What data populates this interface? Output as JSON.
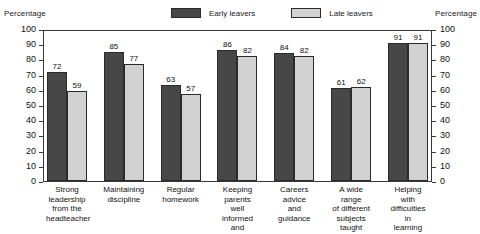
{
  "axis_caption_left": "Percentage",
  "axis_caption_right": "Percentage",
  "legend": {
    "items": [
      {
        "label": "Early leavers",
        "swatch": "dark-gray-swatch",
        "color": "#474747"
      },
      {
        "label": "Late leavers",
        "swatch": "light-gray-swatch",
        "color": "#d2d2d2"
      }
    ]
  },
  "chart_data": {
    "type": "bar",
    "title": "",
    "xlabel": "",
    "ylabel": "Percentage",
    "ylim": [
      0,
      100
    ],
    "yticks": [
      0,
      10,
      20,
      30,
      40,
      50,
      60,
      70,
      80,
      90,
      100
    ],
    "ytick_labels": [
      "0",
      "10",
      "20",
      "30",
      "40",
      "50",
      "60",
      "70",
      "80",
      "90",
      "100"
    ],
    "grid": false,
    "legend_position": "top-center",
    "dual_axis": true,
    "right_axis_label": "Percentage",
    "categories": [
      "Strong leadership from the headteacher",
      "Maintaining discipline",
      "Regular homework",
      "Keeping parents well informed and involved",
      "Careers advice and guidance",
      "A wide range of different subjects taught",
      "Helping with difficulties in learning"
    ],
    "category_lines": [
      [
        "Strong",
        "leadership",
        "from the",
        "headteacher"
      ],
      [
        "Maintaining",
        "discipline"
      ],
      [
        "Regular",
        "homework"
      ],
      [
        "Keeping",
        "parents",
        "well informed",
        "and involved"
      ],
      [
        "Careers",
        "advice",
        "and",
        "guidance"
      ],
      [
        "A wide range",
        "of different",
        "subjects",
        "taught"
      ],
      [
        "Helping with",
        "difficulties in",
        "learning"
      ]
    ],
    "series": [
      {
        "name": "Early leavers",
        "color": "#474747",
        "values": [
          72,
          85,
          63,
          86,
          84,
          61,
          91
        ]
      },
      {
        "name": "Late leavers",
        "color": "#d2d2d2",
        "values": [
          59,
          77,
          57,
          82,
          82,
          62,
          91
        ]
      }
    ]
  }
}
